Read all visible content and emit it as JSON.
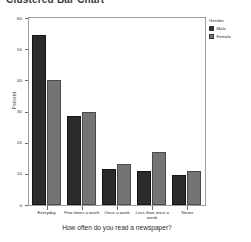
{
  "title": "Clustered Bar Chart",
  "chart_data": {
    "type": "bar",
    "title": "Clustered Bar Chart",
    "xlabel": "How often do you read a newspaper?",
    "ylabel": "Percent",
    "ylim": [
      0,
      60
    ],
    "yticks": [
      0,
      10,
      20,
      30,
      40,
      50,
      60
    ],
    "grid": false,
    "legend_position": "right",
    "legend_title": "Gender",
    "categories": [
      "Everyday",
      "Few times a week",
      "Once a week",
      "Less than once a week",
      "Never"
    ],
    "series": [
      {
        "name": "Male",
        "color": "#2b2b2b",
        "values": [
          54.5,
          28.5,
          11.5,
          11.0,
          9.5
        ]
      },
      {
        "name": "Female",
        "color": "#747474",
        "values": [
          40.0,
          30.0,
          13.0,
          17.0,
          11.0
        ]
      }
    ]
  }
}
